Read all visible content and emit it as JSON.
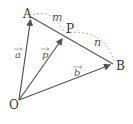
{
  "diagram": {
    "points": {
      "O": {
        "label": "O",
        "x": 19,
        "y": 100
      },
      "A": {
        "label": "A",
        "x": 31,
        "y": 17
      },
      "P": {
        "label": "P",
        "x": 64,
        "y": 36
      },
      "B": {
        "label": "B",
        "x": 113,
        "y": 64
      }
    },
    "vectors": {
      "a": {
        "label": "a",
        "from": "O",
        "to": "A"
      },
      "p": {
        "label": "p",
        "from": "O",
        "to": "P"
      },
      "b": {
        "label": "b",
        "from": "O",
        "to": "B"
      }
    },
    "segment": {
      "from": "A",
      "to": "B"
    },
    "ratio": {
      "m": "m",
      "n": "n"
    },
    "colors": {
      "line": "#555555",
      "arc": "#999999",
      "text": "#333333"
    }
  }
}
